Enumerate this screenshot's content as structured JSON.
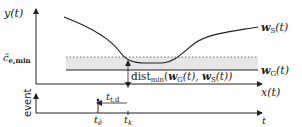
{
  "diagram": {
    "colors": {
      "stroke": "#222222",
      "band_fill": "#e6e6e6",
      "dotted": "#777777",
      "background": "#ffffff"
    },
    "top_plot": {
      "y_axis_label_main": "y",
      "y_axis_label_arg": "(t)",
      "x_axis_label_main": "x",
      "x_axis_label_arg": "(t)",
      "threshold_label_main": "c̃",
      "threshold_label_sub": "e,min",
      "ws_label_main": "w",
      "ws_label_sub": "S",
      "ws_label_arg": "(t)",
      "wg_label_main": "w",
      "wg_label_sub": "G",
      "wg_label_arg": "(t)",
      "dist_label_main": "dist",
      "dist_label_sub": "min",
      "dist_label_open": "(",
      "dist_label_w1": "w",
      "dist_label_w1_sub": "G",
      "dist_label_mid": "(t), ",
      "dist_label_w2": "w",
      "dist_label_w2_sub": "S",
      "dist_label_close": "(t))"
    },
    "bottom_plot": {
      "y_axis_label": "event",
      "x_axis_label": "t",
      "tick_e_main": "t",
      "tick_e_sub": "ẽ",
      "tick_k_main": "t",
      "tick_k_sub": "k",
      "interval_main": "t",
      "interval_sub": "t,d"
    }
  }
}
